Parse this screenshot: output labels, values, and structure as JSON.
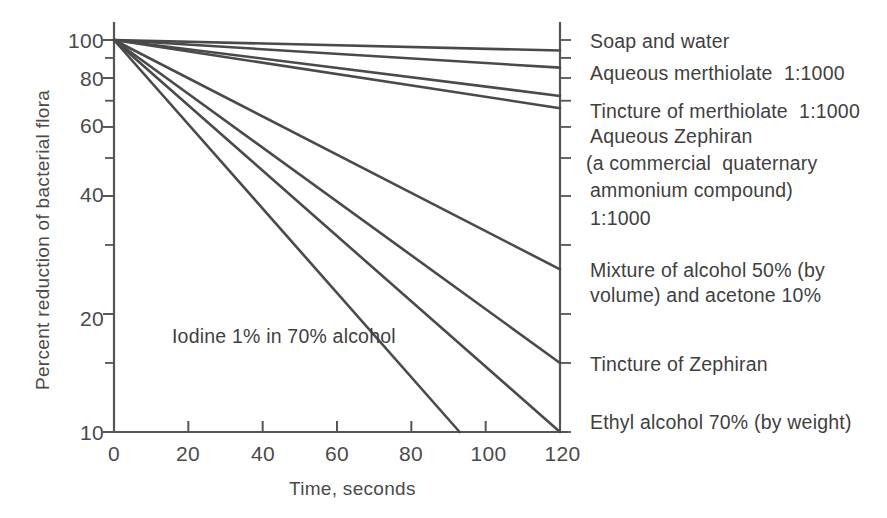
{
  "chart_data": {
    "type": "line",
    "title": "",
    "xlabel": "Time, seconds",
    "ylabel": "Percent reduction of bacterial flora",
    "xlim": [
      0,
      120
    ],
    "ylim": [
      10,
      100
    ],
    "yscale": "log",
    "grid": false,
    "legend_position": "right-of-plot (inline end labels)",
    "xticks": [
      0,
      20,
      40,
      60,
      80,
      100,
      120
    ],
    "xtick_labels": [
      "0",
      "20",
      "40",
      "60",
      "80",
      "100",
      "120"
    ],
    "yticks": [
      100,
      80,
      60,
      40,
      20,
      10
    ],
    "ytick_labels": [
      "100",
      "80",
      "60",
      "40",
      "20",
      "10"
    ],
    "yminor_ticks": [
      90,
      70,
      50,
      30,
      15
    ],
    "annotations": [
      {
        "text": "Iodine 1% in 70% alcohol",
        "x": 22,
        "y": 19.5
      }
    ],
    "series": [
      {
        "name": "Soap and water",
        "label_lines": [
          "Soap and water"
        ],
        "x": [
          0,
          120
        ],
        "values": [
          100,
          94
        ]
      },
      {
        "name": "Aqueous merthiolate 1:1000",
        "label_lines": [
          "Aqueous merthiolate  1:1000"
        ],
        "x": [
          0,
          120
        ],
        "values": [
          100,
          85
        ]
      },
      {
        "name": "Tincture of merthiolate 1:1000",
        "label_lines": [
          "Tincture of merthiolate  1:1000"
        ],
        "x": [
          0,
          120
        ],
        "values": [
          100,
          72
        ]
      },
      {
        "name": "Aqueous Zephiran 1:1000",
        "label_lines": [
          "Aqueous Zephiran",
          "(a commercial  quaternary",
          "ammonium compound)",
          "1:1000"
        ],
        "x": [
          0,
          120
        ],
        "values": [
          100,
          67
        ]
      },
      {
        "name": "Mixture of alcohol 50% (by volume) and acetone 10%",
        "label_lines": [
          "Mixture of alcohol 50% (by",
          "volume) and acetone 10%"
        ],
        "x": [
          0,
          120
        ],
        "values": [
          100,
          26
        ]
      },
      {
        "name": "Tincture of Zephiran",
        "label_lines": [
          "Tincture of Zephiran"
        ],
        "x": [
          0,
          120
        ],
        "values": [
          100,
          15
        ]
      },
      {
        "name": "Ethyl alcohol 70% (by weight)",
        "label_lines": [
          "Ethyl alcohol 70% (by weight)"
        ],
        "x": [
          0,
          120
        ],
        "values": [
          100,
          10
        ]
      },
      {
        "name": "Iodine 1% in 70% alcohol",
        "label_lines": [],
        "x": [
          0,
          93
        ],
        "values": [
          100,
          10
        ]
      }
    ],
    "colors": {
      "line": "#4a4a4a",
      "axis": "#555555",
      "text": "#3f3f3f",
      "background": "#ffffff"
    }
  },
  "axes": {
    "y_title": "Percent reduction of bacterial flora",
    "x_title": "Time, seconds"
  },
  "labels": {
    "y_ticks": [
      "100",
      "80",
      "60",
      "40",
      "20",
      "10"
    ],
    "x_ticks": [
      "0",
      "20",
      "40",
      "60",
      "80",
      "100",
      "120"
    ]
  },
  "series_labels": {
    "s0_l0": "Soap and water",
    "s1_l0": "Aqueous merthiolate  1:1000",
    "s2_l0": "Tincture of merthiolate  1:1000",
    "s3_l0": "Aqueous Zephiran",
    "s3_l1": "(a commercial  quaternary",
    "s3_l2": "ammonium compound)",
    "s3_l3": "1:1000",
    "s4_l0": "Mixture of alcohol 50% (by",
    "s4_l1": "volume) and acetone 10%",
    "s5_l0": "Tincture of Zephiran",
    "s6_l0": "Ethyl alcohol 70% (by weight)"
  },
  "annotations": {
    "iodine": "Iodine 1% in 70% alcohol"
  }
}
